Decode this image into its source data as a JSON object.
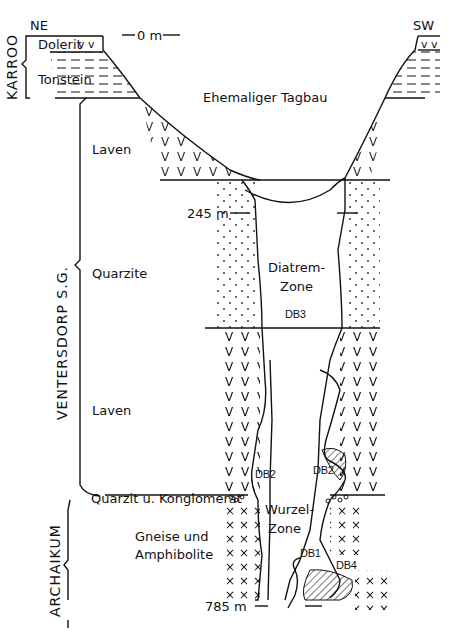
{
  "diagram": {
    "type": "geological-cross-section",
    "orientation": {
      "left": "NE",
      "right": "SW"
    },
    "surface_label": "Ehemaliger Tagbau",
    "depth_markers": [
      {
        "label": "0 m",
        "depth_m": 0
      },
      {
        "label": "245 m",
        "depth_m": 245
      },
      {
        "label": "785 m",
        "depth_m": 785
      }
    ],
    "groups": [
      {
        "name": "KARROO",
        "units": [
          "Dolerit",
          "Tonstein"
        ]
      },
      {
        "name": "VENTERSDORP S.G.",
        "units": [
          "Laven",
          "Quarzite",
          "Laven",
          "Quarzit u. Konglomerat"
        ]
      },
      {
        "name": "ARCHAIKUM",
        "units": [
          "Gneise und Amphibolite"
        ]
      }
    ],
    "units": {
      "dolerit": "Dolerit",
      "tonstein": "Tonstein",
      "laven_upper": "Laven",
      "quarzite": "Quarzite",
      "laven_lower": "Laven",
      "quarzit_konglomerat": "Quarzit u. Konglomerat",
      "gneise_line1": "Gneise und",
      "gneise_line2": "Amphibolite"
    },
    "zones": {
      "diatrem_line1": "Diatrem-",
      "diatrem_line2": "Zone",
      "wurzel_line1": "Wurzel-",
      "wurzel_line2": "Zone"
    },
    "dikes": [
      "DB1",
      "DB2",
      "DB2",
      "DB3",
      "DB4"
    ],
    "group_labels": {
      "karroo": "KARROO",
      "ventersdorp": "VENTERSDORP  S.G.",
      "archaikum": "ARCHAIKUM"
    },
    "labels": {
      "ne": "NE",
      "sw": "SW",
      "zero": "0 m",
      "d245": "245 m",
      "d785": "785 m",
      "db1": "DB1",
      "db2_left": "DB2",
      "db2_right": "DB2",
      "db3": "DB3",
      "db4": "DB4"
    },
    "colors": {
      "ink": "#111111",
      "background": "#ffffff"
    }
  }
}
